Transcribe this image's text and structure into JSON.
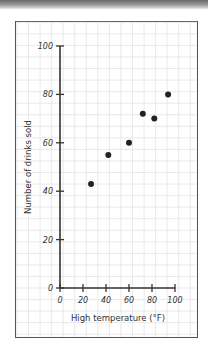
{
  "chart_data": {
    "type": "scatter",
    "title": "",
    "xlabel": "High temperature (°F)",
    "ylabel": "Number of drinks sold",
    "xlim": [
      0,
      100
    ],
    "ylim": [
      0,
      100
    ],
    "x_ticks": [
      0,
      20,
      40,
      60,
      80,
      100
    ],
    "y_ticks": [
      0,
      20,
      40,
      60,
      80,
      100
    ],
    "grid": true,
    "legend": null,
    "points": [
      {
        "x": 27,
        "y": 43
      },
      {
        "x": 42,
        "y": 55
      },
      {
        "x": 60,
        "y": 60
      },
      {
        "x": 72,
        "y": 72
      },
      {
        "x": 82,
        "y": 70
      },
      {
        "x": 94,
        "y": 80
      }
    ]
  },
  "colors": {
    "axis": "#333333",
    "grid": "#e3e3e3",
    "point": "#222222",
    "frame": "#555555"
  }
}
